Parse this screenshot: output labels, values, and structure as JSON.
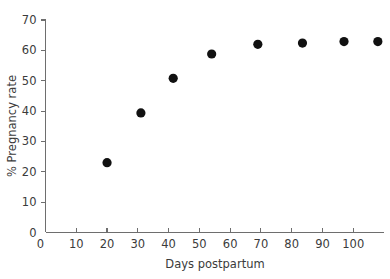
{
  "chart_data": {
    "type": "scatter",
    "title": "",
    "xlabel": "Days postpartum",
    "ylabel": "% Pregnancy rate",
    "xlim": [
      0,
      110
    ],
    "ylim": [
      0,
      70
    ],
    "xticks": [
      0,
      10,
      20,
      30,
      40,
      50,
      60,
      70,
      80,
      90,
      100
    ],
    "yticks": [
      0,
      10,
      20,
      30,
      40,
      50,
      60,
      70
    ],
    "grid": false,
    "legend": null,
    "marker": "filled-circle",
    "marker_color": "#111111",
    "points": [
      {
        "x": 20,
        "y": 23.0
      },
      {
        "x": 31,
        "y": 39.4
      },
      {
        "x": 41.5,
        "y": 50.8
      },
      {
        "x": 54,
        "y": 58.8
      },
      {
        "x": 69,
        "y": 62.0
      },
      {
        "x": 83.5,
        "y": 62.4
      },
      {
        "x": 97,
        "y": 62.9
      },
      {
        "x": 108,
        "y": 62.9
      }
    ],
    "x": [
      20,
      31,
      41.5,
      54,
      69,
      83.5,
      97,
      108
    ],
    "values": [
      23.0,
      39.4,
      50.8,
      58.8,
      62.0,
      62.4,
      62.9,
      62.9
    ]
  }
}
